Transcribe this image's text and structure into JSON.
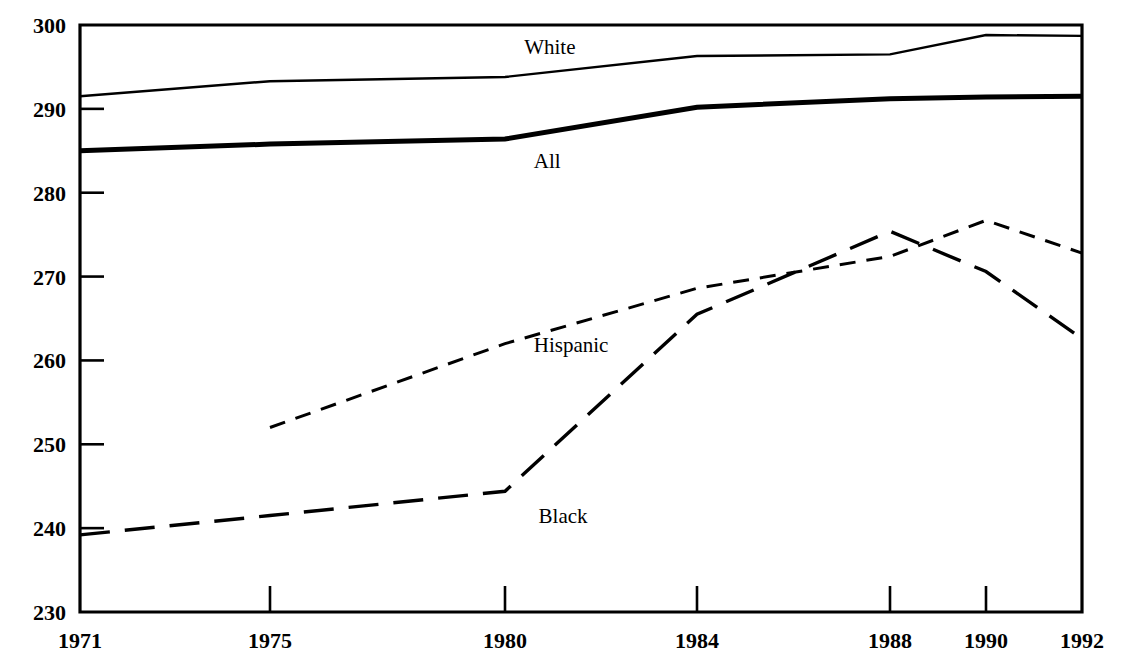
{
  "chart_data": {
    "type": "line",
    "title": "",
    "subtitle": "",
    "xlabel": "",
    "ylabel": "",
    "xlim": [
      1971,
      1992
    ],
    "ylim": [
      230,
      300
    ],
    "grid": false,
    "legend_position": "inline-labels",
    "x_tick_labels": [
      "1971",
      "1975",
      "1980",
      "1984",
      "1988",
      "1990",
      "1992"
    ],
    "x_ticks": [
      1971,
      1975,
      1980,
      1984,
      1988,
      1990,
      1992
    ],
    "y_tick_labels": [
      "230",
      "240",
      "250",
      "260",
      "270",
      "280",
      "290",
      "300"
    ],
    "y_ticks": [
      230,
      240,
      250,
      260,
      270,
      280,
      290,
      300
    ],
    "series": [
      {
        "name": "White",
        "style": "solid-thin",
        "label": "White",
        "label_x": 1980.4,
        "label_y": 296.6,
        "x": [
          1971,
          1975,
          1980,
          1984,
          1988,
          1990,
          1992
        ],
        "values": [
          291.5,
          293.3,
          293.8,
          296.3,
          296.5,
          298.8,
          298.7
        ]
      },
      {
        "name": "All",
        "style": "solid-thick",
        "label": "All",
        "label_x": 1980.6,
        "label_y": 283.0,
        "x": [
          1971,
          1975,
          1980,
          1984,
          1988,
          1990,
          1992
        ],
        "values": [
          285.0,
          285.8,
          286.4,
          290.2,
          291.2,
          291.4,
          291.5
        ]
      },
      {
        "name": "Hispanic",
        "style": "dashed-short",
        "label": "Hispanic",
        "label_x": 1980.6,
        "label_y": 261.0,
        "x": [
          1975,
          1980,
          1984,
          1988,
          1990,
          1992
        ],
        "values": [
          252.0,
          262.0,
          268.6,
          272.4,
          276.7,
          272.8
        ]
      },
      {
        "name": "Black",
        "style": "dashed-long",
        "label": "Black",
        "label_x": 1980.7,
        "label_y": 240.6,
        "x": [
          1971,
          1975,
          1980,
          1984,
          1988,
          1990,
          1992
        ],
        "values": [
          239.2,
          241.5,
          244.4,
          265.5,
          275.4,
          270.6,
          262.6
        ]
      }
    ]
  }
}
